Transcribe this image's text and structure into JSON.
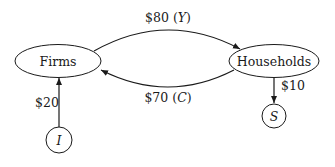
{
  "nodes": {
    "firms": {
      "label": "Firms"
    },
    "households": {
      "label": "Households"
    },
    "investment": {
      "label": "I"
    },
    "saving": {
      "label": "S"
    }
  },
  "flows": {
    "income": {
      "amount": "$80",
      "symbol": "Y"
    },
    "consumption": {
      "amount": "$70",
      "symbol": "C"
    },
    "investment": {
      "amount": "$20"
    },
    "saving": {
      "amount": "$10"
    }
  },
  "colors": {
    "stroke": "#1a1a1a",
    "background": "#ffffff"
  }
}
